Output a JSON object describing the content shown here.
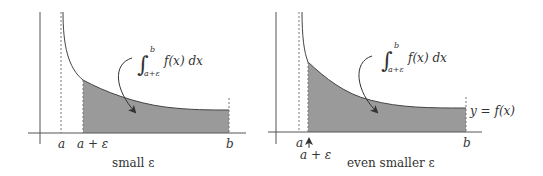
{
  "left_panel": {
    "caption": "small ε",
    "tick_a": "a",
    "tick_a_eps": "a + ε",
    "tick_b": "b",
    "integral": {
      "upper": "b",
      "lower": "a+ε",
      "integrand": "f(x) dx"
    }
  },
  "right_panel": {
    "caption": "even smaller ε",
    "tick_a": "a",
    "tick_a_eps": "a + ε",
    "tick_b": "b",
    "curve_label": "y = f(x)",
    "integral": {
      "upper": "b",
      "lower": "a+ε",
      "integrand": "f(x) dx"
    }
  },
  "colors": {
    "shade": "#9a9a9a",
    "line": "#444444",
    "axis": "#555555"
  }
}
